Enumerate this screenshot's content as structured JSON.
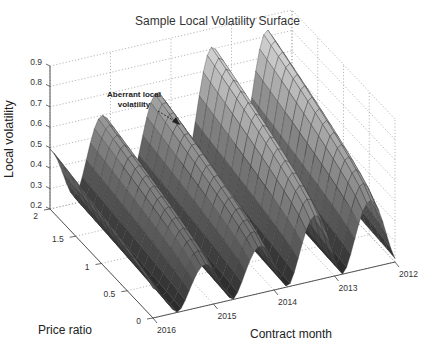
{
  "chart_data": {
    "type": "surface3d",
    "title": "Sample Local Volatility Surface",
    "xlabel": "Contract month",
    "ylabel": "Price ratio",
    "zlabel": "Local volatility",
    "x_ticks": [
      "2016",
      "2015",
      "2014",
      "2013",
      "2012"
    ],
    "y_ticks": [
      "0",
      "0.5",
      "1",
      "1.5",
      "2"
    ],
    "z_ticks": [
      "0.2",
      "0.3",
      "0.4",
      "0.5",
      "0.6",
      "0.7",
      "0.8",
      "0.9"
    ],
    "zlim": [
      0.2,
      0.9
    ],
    "ylim": [
      0,
      2
    ],
    "xlim": [
      "2012",
      "2016"
    ],
    "grid": true,
    "colormap": "gray",
    "annotations": [
      {
        "text": "Aberrant local volatility",
        "arrow_to": "ridge near 2015",
        "position": "upper-left"
      }
    ],
    "surface_description": "Seasonal ridges: four to five peaks along contract month (one per year) with troughs at low price ratio; ridge heights rise toward 2012 (~0.8) and fall toward 2016 (~0.45–0.55).",
    "ridge_peaks": [
      {
        "contract_month": "2016",
        "peak_local_volatility": 0.47
      },
      {
        "contract_month": "2015.5",
        "peak_local_volatility": 0.57
      },
      {
        "contract_month": "2015",
        "peak_local_volatility": 0.62
      },
      {
        "contract_month": "2014",
        "peak_local_volatility": 0.78
      },
      {
        "contract_month": "2013",
        "peak_local_volatility": 0.8
      }
    ],
    "trough_local_volatility": 0.2
  },
  "labels": {
    "title": "Sample Local Volatility Surface",
    "zlabel": "Local volatility",
    "xlabel": "Contract month",
    "ylabel": "Price ratio",
    "annotation_line1": "Aberrant local",
    "annotation_line2": "volatility"
  }
}
